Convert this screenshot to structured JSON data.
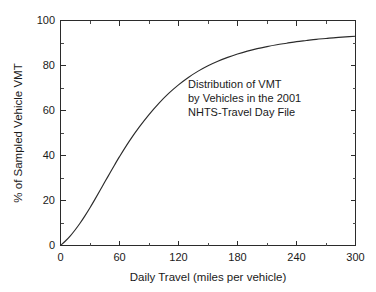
{
  "chart_data": {
    "type": "line",
    "title": "",
    "subtitle": "",
    "xlabel": "Daily Travel (miles per vehicle)",
    "ylabel": "% of Sampled Vehicle VMT",
    "xlim": [
      0,
      300
    ],
    "ylim": [
      0,
      100
    ],
    "grid": false,
    "legend_position": "none",
    "x_ticks": [
      0,
      60,
      120,
      180,
      240,
      300
    ],
    "y_ticks": [
      0,
      20,
      40,
      60,
      80,
      100
    ],
    "x_tick_labels": [
      "0",
      "60",
      "120",
      "180",
      "240",
      "300"
    ],
    "y_tick_labels": [
      "0",
      "20",
      "40",
      "60",
      "80",
      "100"
    ],
    "x_minor_interval": 30,
    "y_minor_interval": 10,
    "series": [
      {
        "name": "Cumulative % of Sampled Vehicle VMT",
        "x": [
          0,
          5,
          10,
          15,
          20,
          25,
          30,
          35,
          40,
          45,
          50,
          55,
          60,
          70,
          80,
          90,
          100,
          110,
          120,
          130,
          140,
          150,
          160,
          170,
          180,
          190,
          200,
          210,
          220,
          230,
          240,
          250,
          260,
          270,
          280,
          290,
          300
        ],
        "values": [
          0,
          2.0,
          4.3,
          7.0,
          10.0,
          13.3,
          16.8,
          20.5,
          24.3,
          28.2,
          32.0,
          35.8,
          39.5,
          46.4,
          52.6,
          58.2,
          63.2,
          67.6,
          71.4,
          74.7,
          77.5,
          79.9,
          81.9,
          83.6,
          85.1,
          86.4,
          87.5,
          88.4,
          89.2,
          89.9,
          90.6,
          91.1,
          91.6,
          92.0,
          92.4,
          92.7,
          93.0
        ]
      }
    ],
    "annotations": [
      {
        "name": "distribution-caption",
        "lines": [
          "Distribution of VMT",
          "by Vehicles in the 2001",
          "NHTS-Travel Day File"
        ],
        "x": 130,
        "y": 72
      }
    ],
    "colors": {
      "curve": "#2b2b2b",
      "axis": "#2b2b2b",
      "background": "#ffffff",
      "text": "#1a1a1a"
    }
  },
  "axis_titles": {
    "x": "Daily Travel (miles per vehicle)",
    "y": "% of Sampled Vehicle VMT"
  },
  "annotation": {
    "line1": "Distribution of VMT",
    "line2": "by Vehicles in the 2001",
    "line3": "NHTS-Travel Day File"
  },
  "x_labels": {
    "t0": "0",
    "t1": "60",
    "t2": "120",
    "t3": "180",
    "t4": "240",
    "t5": "300"
  },
  "y_labels": {
    "t0": "0",
    "t1": "20",
    "t2": "40",
    "t3": "60",
    "t4": "80",
    "t5": "100"
  }
}
